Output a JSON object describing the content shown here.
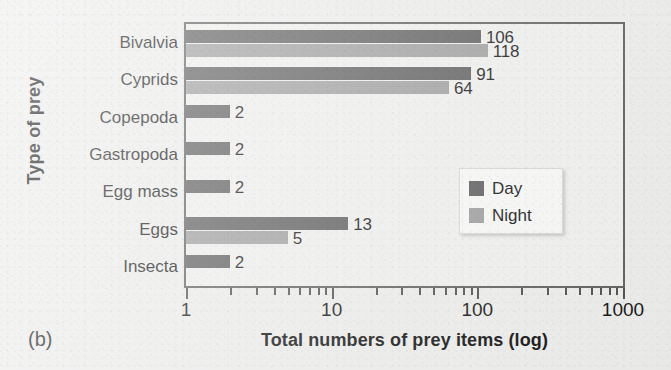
{
  "panel": {
    "label": "(b)"
  },
  "legend": {
    "position": "inside-right",
    "entries": [
      {
        "name": "Day",
        "color": "#5c5c5c",
        "swatch": "day"
      },
      {
        "name": "Night",
        "color": "#9d9d9d",
        "swatch": "night"
      }
    ]
  },
  "axes": {
    "x": {
      "title": "Total numbers of prey items (log)",
      "scale": "log10",
      "range": [
        1,
        1000
      ],
      "major_ticks": [
        1,
        10,
        100,
        1000
      ],
      "tick_labels": [
        "1",
        "10",
        "100",
        "1000"
      ],
      "minor_ticks": [
        2,
        3,
        4,
        5,
        6,
        7,
        8,
        9,
        20,
        30,
        40,
        50,
        60,
        70,
        80,
        90,
        200,
        300,
        400,
        500,
        600,
        700,
        800,
        900
      ]
    },
    "y": {
      "title": "Type of prey",
      "categories": [
        "Bivalvia",
        "Cyprids",
        "Copepoda",
        "Gastropoda",
        "Egg mass",
        "Eggs",
        "Insecta"
      ]
    }
  },
  "chart_data": {
    "type": "bar",
    "orientation": "horizontal",
    "title": "",
    "xlabel": "Total numbers of prey items (log)",
    "ylabel": "Type of prey",
    "xscale": "log",
    "xlim": [
      1,
      1000
    ],
    "grid": false,
    "legend_position": "inside-right",
    "categories": [
      "Bivalvia",
      "Cyprids",
      "Copepoda",
      "Gastropoda",
      "Egg mass",
      "Eggs",
      "Insecta"
    ],
    "series": [
      {
        "name": "Day",
        "color": "#5c5c5c",
        "values": [
          106,
          91,
          2,
          2,
          2,
          13,
          2
        ],
        "labels": [
          "106",
          "91",
          "2",
          "2",
          "2",
          "13",
          "2"
        ]
      },
      {
        "name": "Night",
        "color": "#9d9d9d",
        "values": [
          118,
          64,
          null,
          null,
          null,
          5,
          null
        ],
        "labels": [
          "118",
          "64",
          "",
          "",
          "",
          "5",
          ""
        ]
      }
    ]
  }
}
